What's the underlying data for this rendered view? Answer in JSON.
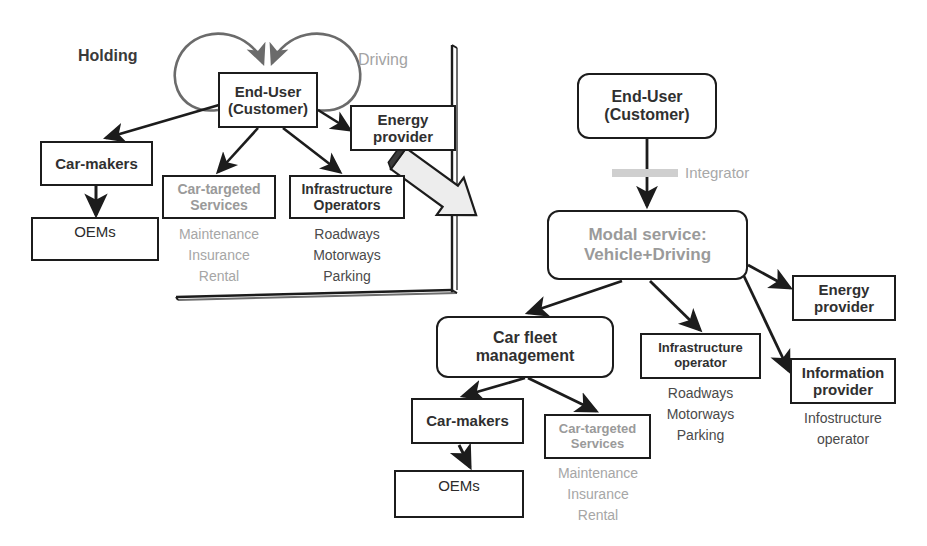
{
  "diagram": {
    "colors": {
      "stroke": "#1c1c1c",
      "bold_dark_text": "#303030",
      "bold_gray_text": "#9a9a9a",
      "gray_text": "#a6a6a6",
      "dark_text": "#4a4a4a",
      "big_arrow_fill": "#ededed",
      "integrator_swatch": "#cfcfcf",
      "background": "#ffffff"
    },
    "left_panel": {
      "edge_labels": {
        "holding": "Holding",
        "driving": "Driving"
      },
      "nodes": {
        "end_user": {
          "line1": "End-User",
          "line2": "(Customer)"
        },
        "energy_provider": {
          "line1": "Energy",
          "line2": "provider"
        },
        "car_makers": {
          "line1": "Car-makers"
        },
        "oems": {
          "line1": "OEMs"
        },
        "car_targeted_services": {
          "line1": "Car-targeted",
          "line2": "Services"
        },
        "infrastructure_operators": {
          "line1": "Infrastructure",
          "line2": "Operators"
        }
      },
      "lists": {
        "car_targeted_services": [
          "Maintenance",
          "Insurance",
          "Rental"
        ],
        "infrastructure_operators": [
          "Roadways",
          "Motorways",
          "Parking"
        ]
      }
    },
    "right_panel": {
      "edge_labels": {
        "integrator": "Integrator"
      },
      "nodes": {
        "end_user": {
          "line1": "End-User",
          "line2": "(Customer)"
        },
        "modal_service": {
          "line1": "Modal service:",
          "line2": "Vehicle+Driving"
        },
        "car_fleet_management": {
          "line1": "Car fleet",
          "line2": "management"
        },
        "infrastructure_operator": {
          "line1": "Infrastructure",
          "line2": "operator"
        },
        "energy_provider": {
          "line1": "Energy",
          "line2": "provider"
        },
        "information_provider": {
          "line1": "Information",
          "line2": "provider"
        },
        "car_makers": {
          "line1": "Car-makers"
        },
        "oems": {
          "line1": "OEMs"
        },
        "car_targeted_services": {
          "line1": "Car-targeted",
          "line2": "Services"
        }
      },
      "lists": {
        "infrastructure_operator": [
          "Roadways",
          "Motorways",
          "Parking"
        ],
        "information_provider": [
          "Infostructure",
          "operator"
        ],
        "car_targeted_services": [
          "Maintenance",
          "Insurance",
          "Rental"
        ]
      }
    }
  }
}
